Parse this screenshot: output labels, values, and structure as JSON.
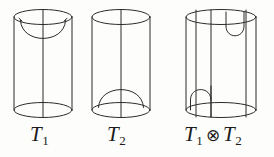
{
  "figure": {
    "kind": "math-diagram",
    "background_color": "#fdfdfb",
    "line_color": "#2b2b2b",
    "line_width": 1.0,
    "panels": [
      {
        "id": "panel-t1",
        "name": "cylinder-t1",
        "label": {
          "base": "T",
          "sub": "1",
          "full": "T1"
        },
        "cylinder": {
          "cx": 43,
          "top_y": 17,
          "bottom_y": 110,
          "rx": 29,
          "ry": 7.5
        },
        "features": [
          "top-cup",
          "center-vertical-strand"
        ]
      },
      {
        "id": "panel-t2",
        "name": "cylinder-t2",
        "label": {
          "base": "T",
          "sub": "2",
          "full": "T2"
        },
        "cylinder": {
          "cx": 121,
          "top_y": 17,
          "bottom_y": 110,
          "rx": 29,
          "ry": 7.5
        },
        "features": [
          "bottom-cap",
          "center-vertical-strand"
        ]
      },
      {
        "id": "panel-t1t2",
        "name": "cylinder-t1-tensor-t2",
        "label": {
          "base": "T",
          "sub": "1",
          "op": "⊗",
          "base2": "T",
          "sub2": "2",
          "full": "T1 ⊗ T2"
        },
        "cylinder": {
          "cx": 221,
          "top_y": 17,
          "bottom_y": 110,
          "rx": 35,
          "ry": 7.5
        },
        "features": [
          "top-cup-right",
          "bottom-cap-left",
          "four-vertical-strands"
        ],
        "strand_x": [
          196,
          211,
          226,
          246
        ]
      }
    ]
  },
  "labels": {
    "t1": {
      "base": "T",
      "sub": "1"
    },
    "t2": {
      "base": "T",
      "sub": "2"
    },
    "tensor": {
      "base1": "T",
      "sub1": "1",
      "op": "⊗",
      "base2": "T",
      "sub2": "2"
    }
  }
}
